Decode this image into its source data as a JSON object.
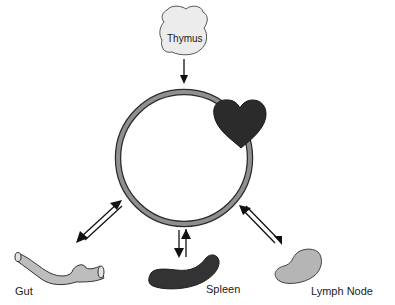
{
  "diagram": {
    "center": {
      "name": "Blood circulation",
      "shape": "ring",
      "attached": "Heart"
    },
    "nodes": [
      {
        "id": "thymus",
        "label": "Thymus",
        "color": "#e8e8e8"
      },
      {
        "id": "heart",
        "label": "",
        "color": "#2a2a2a"
      },
      {
        "id": "gut",
        "label": "Gut",
        "color": "#bdbdbd"
      },
      {
        "id": "spleen",
        "label": "Spleen",
        "color": "#333333"
      },
      {
        "id": "lymph_node",
        "label": "Lymph Node",
        "color": "#b5b5b5"
      }
    ],
    "edges": [
      {
        "from": "thymus",
        "to": "circulation",
        "type": "one-way"
      },
      {
        "from": "circulation",
        "to": "gut",
        "type": "two-way"
      },
      {
        "from": "circulation",
        "to": "spleen",
        "type": "two-way"
      },
      {
        "from": "circulation",
        "to": "lymph_node",
        "type": "two-way"
      }
    ],
    "colors": {
      "ring": "#8a8a8a",
      "ring_outline": "#2b2b2b",
      "arrow": "#111111"
    }
  }
}
